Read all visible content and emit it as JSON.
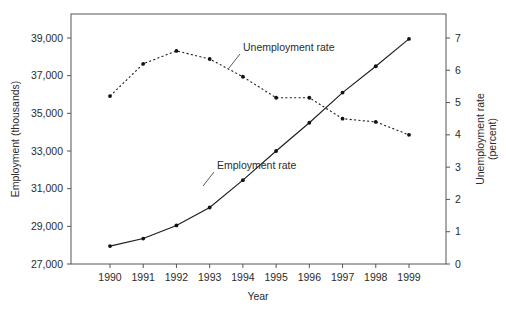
{
  "chart_data": {
    "type": "line",
    "title": "",
    "xlabel": "Year",
    "ylabel": "Employment (thousands)",
    "y2label": "Unemployment rate (percent)",
    "y2label_line1": "Unemployment rate",
    "y2label_line2": "(percent)",
    "grid": false,
    "legend_position": "inline-annotation",
    "categories": [
      "1990",
      "1991",
      "1992",
      "1993",
      "1994",
      "1995",
      "1996",
      "1997",
      "1998",
      "1999"
    ],
    "x": [
      1990,
      1991,
      1992,
      1993,
      1994,
      1995,
      1996,
      1997,
      1998,
      1999
    ],
    "xlim": [
      1989.5,
      1999.5
    ],
    "ylim": [
      27000,
      39000
    ],
    "y2lim": [
      0,
      7
    ],
    "ytick_labels": [
      "27,000",
      "29,000",
      "31,000",
      "33,000",
      "35,000",
      "37,000",
      "39,000"
    ],
    "ytick_values": [
      27000,
      29000,
      31000,
      33000,
      35000,
      37000,
      39000
    ],
    "y2tick_labels": [
      "0",
      "1",
      "2",
      "3",
      "4",
      "5",
      "6",
      "7"
    ],
    "y2tick_values": [
      0,
      1,
      2,
      3,
      4,
      5,
      6,
      7
    ],
    "series": [
      {
        "name": "Employment rate",
        "axis": "left",
        "style": "solid",
        "marker": "dot",
        "color": "#1a1a1a",
        "annotation": "Employment rate",
        "values": [
          27950,
          28350,
          29050,
          30000,
          31450,
          33000,
          34500,
          36100,
          37500,
          38950
        ]
      },
      {
        "name": "Unemployment rate",
        "axis": "right",
        "style": "dotted",
        "marker": "dot",
        "color": "#1a1a1a",
        "annotation": "Unemployment rate",
        "values": [
          5.2,
          6.2,
          6.6,
          6.35,
          5.8,
          5.15,
          5.15,
          4.5,
          4.4,
          4.0
        ]
      }
    ]
  }
}
